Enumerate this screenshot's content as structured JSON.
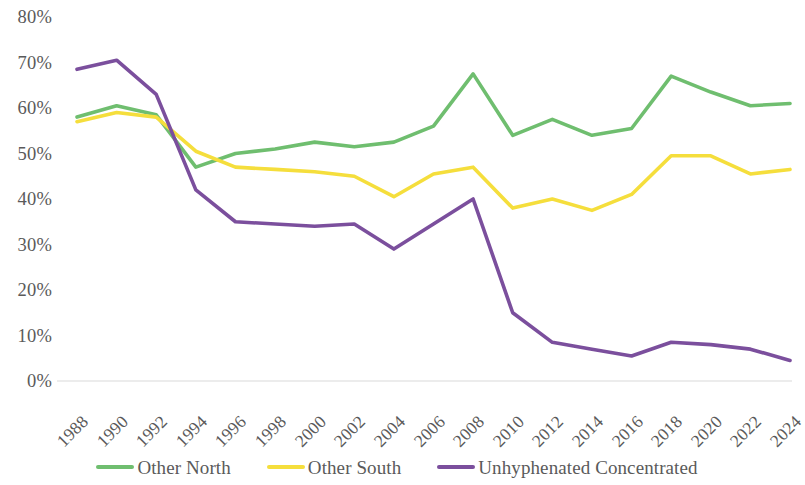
{
  "chart_data": {
    "type": "line",
    "title": "",
    "subtitle": "",
    "xlabel": "",
    "ylabel": "",
    "grid": false,
    "legend_position": "bottom",
    "ylim": [
      0,
      80
    ],
    "y_ticks": [
      "0%",
      "10%",
      "20%",
      "30%",
      "40%",
      "50%",
      "60%",
      "70%",
      "80%"
    ],
    "y_tick_values": [
      0,
      10,
      20,
      30,
      40,
      50,
      60,
      70,
      80
    ],
    "categories": [
      "1988",
      "1990",
      "1992",
      "1994",
      "1996",
      "1998",
      "2000",
      "2002",
      "2004",
      "2006",
      "2008",
      "2010",
      "2012",
      "2014",
      "2016",
      "2018",
      "2020",
      "2022",
      "2024"
    ],
    "x": [
      1988,
      1990,
      1992,
      1994,
      1996,
      1998,
      2000,
      2002,
      2004,
      2006,
      2008,
      2010,
      2012,
      2014,
      2016,
      2018,
      2020,
      2022,
      2024
    ],
    "series": [
      {
        "name": "Other North",
        "color": "#6FBE6F",
        "values": [
          58.0,
          60.5,
          58.5,
          47.0,
          50.0,
          51.0,
          52.5,
          51.5,
          52.5,
          56.0,
          67.5,
          54.0,
          57.5,
          54.0,
          55.5,
          67.0,
          63.5,
          60.5,
          61.0
        ]
      },
      {
        "name": "Other South",
        "color": "#F5DE3C",
        "values": [
          57.0,
          59.0,
          58.0,
          50.5,
          47.0,
          46.5,
          46.0,
          45.0,
          40.5,
          45.5,
          47.0,
          38.0,
          40.0,
          37.5,
          41.0,
          49.5,
          49.5,
          45.5,
          46.5
        ]
      },
      {
        "name": "Unhyphenated Concentrated",
        "color": "#7B4F9D",
        "values": [
          68.5,
          70.5,
          63.0,
          42.0,
          35.0,
          34.5,
          34.0,
          34.5,
          29.0,
          34.5,
          40.0,
          15.0,
          8.5,
          7.0,
          5.5,
          8.5,
          8.0,
          7.0,
          4.5
        ]
      }
    ]
  },
  "legend": {
    "items": [
      {
        "label": "Other North",
        "color": "#6FBE6F"
      },
      {
        "label": "Other South",
        "color": "#F5DE3C"
      },
      {
        "label": "Unhyphenated Concentrated",
        "color": "#7B4F9D"
      }
    ]
  },
  "axis_line_color": "#d9d9d9"
}
